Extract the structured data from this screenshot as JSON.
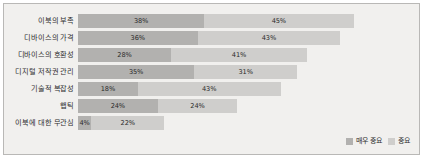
{
  "chart_data": {
    "type": "bar",
    "orientation": "horizontal",
    "stacked": true,
    "title": "",
    "xlabel": "",
    "ylabel": "",
    "grid": false,
    "legend_position": "bottom-right",
    "xlim": [
      0,
      100
    ],
    "value_suffix": "%",
    "categories": [
      "이북의 부족",
      "디바이스의 가격",
      "디바이스의 호환성",
      "디지털 저작권 관리",
      "기술적 복잡성",
      "햅틱",
      "이북에 대한 무관심"
    ],
    "series": [
      {
        "name": "매우 중요",
        "color": "#b2b1af",
        "values": [
          38,
          36,
          28,
          35,
          18,
          24,
          4
        ],
        "labels": [
          "38%",
          "36%",
          "28%",
          "35%",
          "18%",
          "24%",
          "4%"
        ]
      },
      {
        "name": "중요",
        "color": "#cfcecc",
        "values": [
          45,
          43,
          41,
          31,
          43,
          24,
          22
        ],
        "labels": [
          "45%",
          "43%",
          "41%",
          "31%",
          "43%",
          "24%",
          "22%"
        ]
      }
    ],
    "totals": [
      83,
      79,
      69,
      66,
      61,
      48,
      26
    ]
  },
  "style": {
    "background": "#f1f0ee",
    "border_color": "#b9b8b6",
    "text_color": "#2e2e2e"
  }
}
